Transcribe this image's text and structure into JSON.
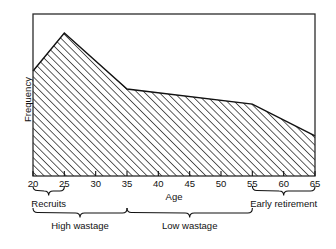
{
  "chart_data": {
    "type": "area",
    "title": "",
    "xlabel": "Age",
    "ylabel": "Frequency",
    "xlim": [
      20,
      65
    ],
    "ylim": [
      0,
      1
    ],
    "grid": false,
    "legend": "none",
    "fill_style": "diagonal-hatch",
    "x": [
      20,
      25,
      35,
      55,
      65
    ],
    "values": [
      0.648,
      0.883,
      0.537,
      0.444,
      0.247
    ],
    "series": [
      {
        "name": "Frequency",
        "x": [
          20,
          25,
          35,
          55,
          65
        ],
        "values": [
          0.648,
          0.883,
          0.537,
          0.444,
          0.247
        ]
      }
    ],
    "xticks": [
      20,
      25,
      30,
      35,
      40,
      45,
      50,
      55,
      60,
      65
    ],
    "xticklabels": [
      "20",
      "25",
      "30",
      "35",
      "40",
      "45",
      "50",
      "55",
      "60",
      "65"
    ],
    "yticks": [],
    "yticklabels": [],
    "annotations": [
      {
        "label": "Recruits",
        "from": 20,
        "to": 25,
        "row": 1
      },
      {
        "label": "Early retirement",
        "from": 55,
        "to": 65,
        "row": 1
      },
      {
        "label": "High  wastage",
        "from": 20,
        "to": 35,
        "row": 2
      },
      {
        "label": "Low wastage",
        "from": 35,
        "to": 55,
        "row": 2
      }
    ]
  },
  "axes": {
    "x_title": "Age",
    "y_title": "Frequency"
  },
  "ticks": {
    "x": [
      {
        "value": 20,
        "label": "20"
      },
      {
        "value": 25,
        "label": "25"
      },
      {
        "value": 30,
        "label": "30"
      },
      {
        "value": 35,
        "label": "35"
      },
      {
        "value": 40,
        "label": "40"
      },
      {
        "value": 45,
        "label": "45"
      },
      {
        "value": 50,
        "label": "50"
      },
      {
        "value": 55,
        "label": "55"
      },
      {
        "value": 60,
        "label": "60"
      },
      {
        "value": 65,
        "label": "65"
      }
    ]
  },
  "annotations": {
    "recruits": "Recruits",
    "early_retirement": "Early retirement",
    "high_wastage": "High  wastage",
    "low_wastage": "Low wastage"
  },
  "colors": {
    "ink": "#111111",
    "frame": "#2b2b2b",
    "hatch": "#2b2b2b",
    "background": "#ffffff"
  }
}
